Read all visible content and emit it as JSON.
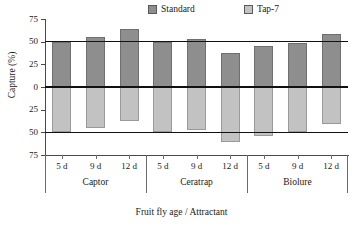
{
  "chart_data": {
    "type": "bar",
    "title": "",
    "xlabel": "Fruit fly age / Attractant",
    "ylabel": "Capture (%)",
    "ylim": [
      -75,
      75
    ],
    "ytick_values": [
      75,
      50,
      25,
      0,
      -25,
      -50,
      -75
    ],
    "ytick_labels": [
      "75",
      "50",
      "25",
      "0",
      "25",
      "50",
      "75"
    ],
    "grid": false,
    "reference_lines": [
      50,
      0,
      -50
    ],
    "legend_position": "top-center",
    "categories": [
      "5 d",
      "9 d",
      "12 d",
      "5 d",
      "9 d",
      "12 d",
      "5 d",
      "9 d",
      "12 d"
    ],
    "groups": [
      {
        "name": "Captor",
        "ages": [
          "5 d",
          "9 d",
          "12 d"
        ]
      },
      {
        "name": "Ceratrap",
        "ages": [
          "5 d",
          "9 d",
          "12 d"
        ]
      },
      {
        "name": "Biolure",
        "ages": [
          "5 d",
          "9 d",
          "12 d"
        ]
      }
    ],
    "series": [
      {
        "name": "Standard",
        "color": "#8e8e8e",
        "values": [
          50,
          55,
          64,
          50,
          53,
          38,
          45,
          49,
          59
        ]
      },
      {
        "name": "Tap-7",
        "color": "#c2c2c2",
        "values": [
          -50,
          -45,
          -37,
          -50,
          -47,
          -61,
          -54,
          -50,
          -41
        ]
      }
    ],
    "bars": [
      {
        "group": "Captor",
        "age": "5 d",
        "standard": 50,
        "tap7": -50
      },
      {
        "group": "Captor",
        "age": "9 d",
        "standard": 55,
        "tap7": -45
      },
      {
        "group": "Captor",
        "age": "12 d",
        "standard": 64,
        "tap7": -37
      },
      {
        "group": "Ceratrap",
        "age": "5 d",
        "standard": 50,
        "tap7": -50
      },
      {
        "group": "Ceratrap",
        "age": "9 d",
        "standard": 53,
        "tap7": -47
      },
      {
        "group": "Ceratrap",
        "age": "12 d",
        "standard": 38,
        "tap7": -61
      },
      {
        "group": "Biolure",
        "age": "5 d",
        "standard": 45,
        "tap7": -54
      },
      {
        "group": "Biolure",
        "age": "9 d",
        "standard": 49,
        "tap7": -50
      },
      {
        "group": "Biolure",
        "age": "12 d",
        "standard": 59,
        "tap7": -41
      }
    ]
  },
  "legend": {
    "standard_label": "Standard",
    "tap7_label": "Tap-7",
    "standard_color": "#8e8e8e",
    "tap7_color": "#c2c2c2"
  },
  "axes": {
    "y_title": "Capture (%)",
    "x_title": "Fruit fly age / Attractant",
    "y_ticks": [
      "75",
      "50",
      "25",
      "0",
      "25",
      "50",
      "75"
    ]
  },
  "xaxis": {
    "ages": [
      "5 d",
      "9 d",
      "12 d",
      "5 d",
      "9 d",
      "12 d",
      "5 d",
      "9 d",
      "12 d"
    ],
    "groups": [
      "Captor",
      "Ceratrap",
      "Biolure"
    ]
  }
}
